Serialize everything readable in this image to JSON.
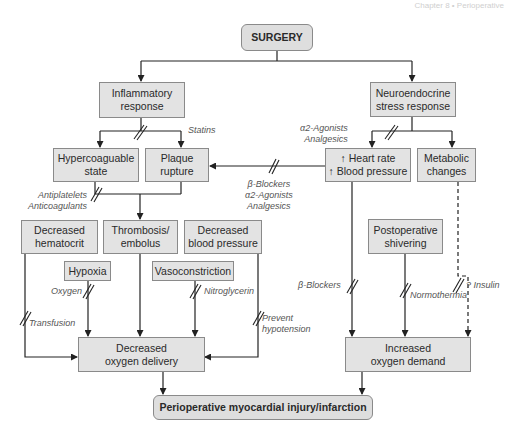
{
  "diagram": {
    "header_fragment": "Chapter 8 • Perioperative",
    "nodes": {
      "surgery": "SURGERY",
      "inflammatory": "Inflammatory\nresponse",
      "neuroendocrine": "Neuroendocrine\nstress response",
      "hypercoagulable": "Hypercoaguable\nstate",
      "plaque": "Plaque\nrupture",
      "heart_rate": "↑ Heart rate\n↑ Blood pressure",
      "metabolic": "Metabolic\nchanges",
      "dec_hematocrit": "Decreased\nhematocrit",
      "thrombosis": "Thrombosis/\nembolus",
      "dec_bp": "Decreased\nblood pressure",
      "hypoxia": "Hypoxia",
      "vasoconstriction": "Vasoconstriction",
      "shivering": "Postoperative\nshivering",
      "dec_o2_delivery": "Decreased\noxygen delivery",
      "inc_o2_demand": "Increased\noxygen demand",
      "outcome": "Perioperative myocardial injury/infarction"
    },
    "interventions": {
      "statins": "Statins",
      "alpha_analgesics_top": "α2-Agonists\nAnalgesics",
      "antiplatelets": "Antiplatelets\nAnticoagulants",
      "beta_alpha_analgesics": "β-Blockers\nα2-Agonists\nAnalgesics",
      "beta_blockers": "β-Blockers",
      "insulin": "? Insulin",
      "oxygen": "Oxygen",
      "nitroglycerin": "Nitroglycerin",
      "transfusion": "Transfusion",
      "prevent_hypotension": "Prevent\nhypotension",
      "normothermia": "Normothermia"
    },
    "colors": {
      "box_fill": "#e3e3e3",
      "box_border": "#8a8a8a",
      "line": "#222222"
    }
  }
}
